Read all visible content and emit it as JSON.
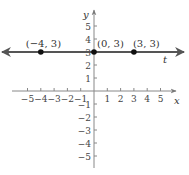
{
  "chart_data": {
    "type": "line",
    "title": "",
    "xlabel": "x",
    "ylabel": "y",
    "line_label": "t",
    "xlim": [
      -5,
      5
    ],
    "ylim": [
      -5,
      5
    ],
    "x_ticks": [
      -5,
      -4,
      -3,
      -2,
      -1,
      1,
      2,
      3,
      4,
      5
    ],
    "y_ticks": [
      -5,
      -4,
      -3,
      -2,
      -1,
      1,
      2,
      3,
      4,
      5
    ],
    "x_tick_labels": [
      "−5",
      "−4",
      "−3",
      "−2",
      "−1",
      "1",
      "2",
      "3",
      "4",
      "5"
    ],
    "y_tick_labels": [
      "−5",
      "−4",
      "−3",
      "−2",
      "−1",
      "1",
      "2",
      "3",
      "4",
      "5"
    ],
    "grid": false,
    "series": [
      {
        "name": "t",
        "equation": "y = 3",
        "x": [
          -4,
          0,
          3
        ],
        "y": [
          3,
          3,
          3
        ],
        "arrows_both_ends": true
      }
    ],
    "annotations": [
      {
        "text": "(−4, 3)",
        "x": -4,
        "y": 3
      },
      {
        "text": "(0, 3)",
        "x": 0,
        "y": 3
      },
      {
        "text": "(3, 3)",
        "x": 3,
        "y": 3
      }
    ]
  },
  "colors": {
    "axis": "#888888",
    "line": "#555555",
    "point": "#111111"
  }
}
